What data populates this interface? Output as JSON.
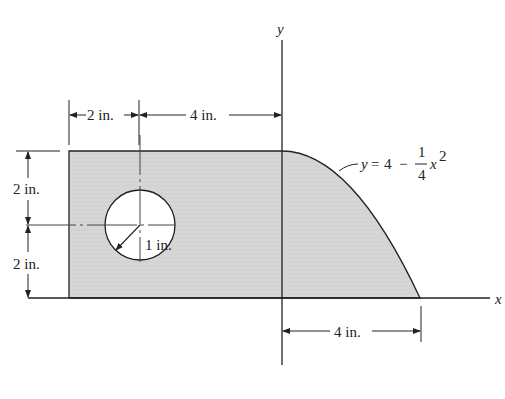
{
  "figure": {
    "axes": {
      "x_label": "x",
      "y_label": "y"
    },
    "curve_equation": {
      "lhs": "y",
      "eq": "=",
      "const": "4",
      "minus": "−",
      "frac_num": "1",
      "frac_den": "4",
      "var": "x",
      "exp": "2"
    },
    "dimensions": {
      "top_left": "2 in.",
      "top_right": "4 in.",
      "left_upper": "2 in.",
      "left_lower": "2 in.",
      "hole_radius": "1 in.",
      "bottom_right": "4 in."
    },
    "colors": {
      "fill": "#d4d4d4",
      "line": "#222222",
      "background": "#ffffff"
    }
  }
}
